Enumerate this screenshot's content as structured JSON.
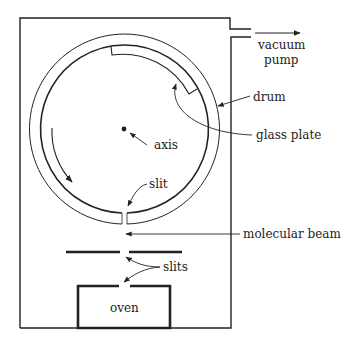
{
  "diagram": {
    "labels": {
      "vacuum": "vacuum",
      "pump": "pump",
      "drum": "drum",
      "glass_plate": "glass plate",
      "axis": "axis",
      "slit": "slit",
      "molecular_beam": "molecular beam",
      "slits": "slits",
      "oven": "oven"
    },
    "colors": {
      "line": "#222222",
      "background": "#ffffff"
    }
  }
}
